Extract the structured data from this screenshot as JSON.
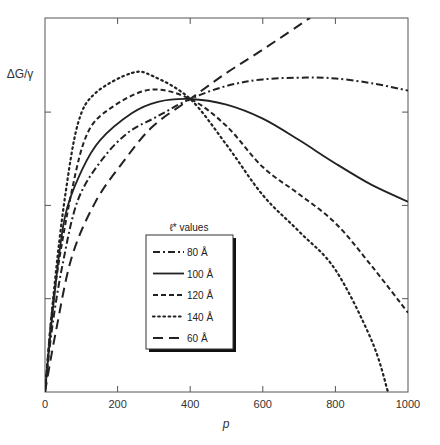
{
  "chart_data": {
    "type": "line",
    "title": "",
    "xlabel": "p",
    "ylabel": "ΔG/γ",
    "xlim": [
      0,
      1000
    ],
    "ylim": [
      0,
      4.0
    ],
    "x_ticks": [
      0,
      200,
      400,
      600,
      800,
      1000
    ],
    "x_tick_labels": [
      "0",
      "200",
      "400",
      "600",
      "800",
      "1000"
    ],
    "y_ticks": [
      1,
      2,
      3
    ],
    "y_tick_labels": [
      "",
      "",
      ""
    ],
    "grid": false,
    "legend": {
      "title": "ℓ* values",
      "position": "lower-center",
      "entries": [
        "80 Å",
        "100 Å",
        "120 Å",
        "140 Å",
        "60 Å"
      ]
    },
    "series": [
      {
        "name": "80 Å",
        "style": "dash-dot",
        "x": [
          0,
          20,
          50,
          91,
          157,
          229,
          303,
          400,
          500,
          600,
          720,
          800,
          900,
          1000
        ],
        "values": [
          0,
          0.7,
          1.4,
          2.06,
          2.49,
          2.78,
          2.94,
          3.14,
          3.28,
          3.35,
          3.37,
          3.36,
          3.31,
          3.23
        ]
      },
      {
        "name": "100 Å",
        "style": "solid",
        "x": [
          0,
          25,
          55,
          102,
          152,
          240,
          311,
          400,
          500,
          600,
          700,
          800,
          900,
          1000
        ],
        "values": [
          0,
          1.0,
          1.88,
          2.38,
          2.7,
          2.99,
          3.11,
          3.14,
          3.08,
          2.93,
          2.7,
          2.45,
          2.22,
          2.04
        ]
      },
      {
        "name": "120 Å",
        "style": "dashed",
        "x": [
          0,
          25,
          74,
          118,
          184,
          290,
          400,
          500,
          600,
          700,
          800,
          900,
          1000
        ],
        "values": [
          0,
          1.05,
          2.16,
          2.78,
          3.05,
          3.24,
          3.14,
          2.85,
          2.41,
          2.12,
          1.81,
          1.35,
          0.85
        ]
      },
      {
        "name": "140 Å",
        "style": "dotted",
        "x": [
          0,
          25,
          55,
          91,
          138,
          240,
          300,
          400,
          500,
          600,
          700,
          800,
          900,
          945
        ],
        "values": [
          0,
          1.1,
          2.09,
          2.88,
          3.2,
          3.42,
          3.38,
          3.14,
          2.65,
          2.11,
          1.72,
          1.31,
          0.55,
          0
        ]
      },
      {
        "name": "60 Å",
        "style": "long-dash",
        "x": [
          0,
          30,
          74,
          138,
          212,
          295,
          400,
          500,
          600,
          730
        ],
        "values": [
          0,
          0.65,
          1.45,
          2.03,
          2.45,
          2.84,
          3.14,
          3.42,
          3.67,
          4.01
        ]
      }
    ]
  }
}
